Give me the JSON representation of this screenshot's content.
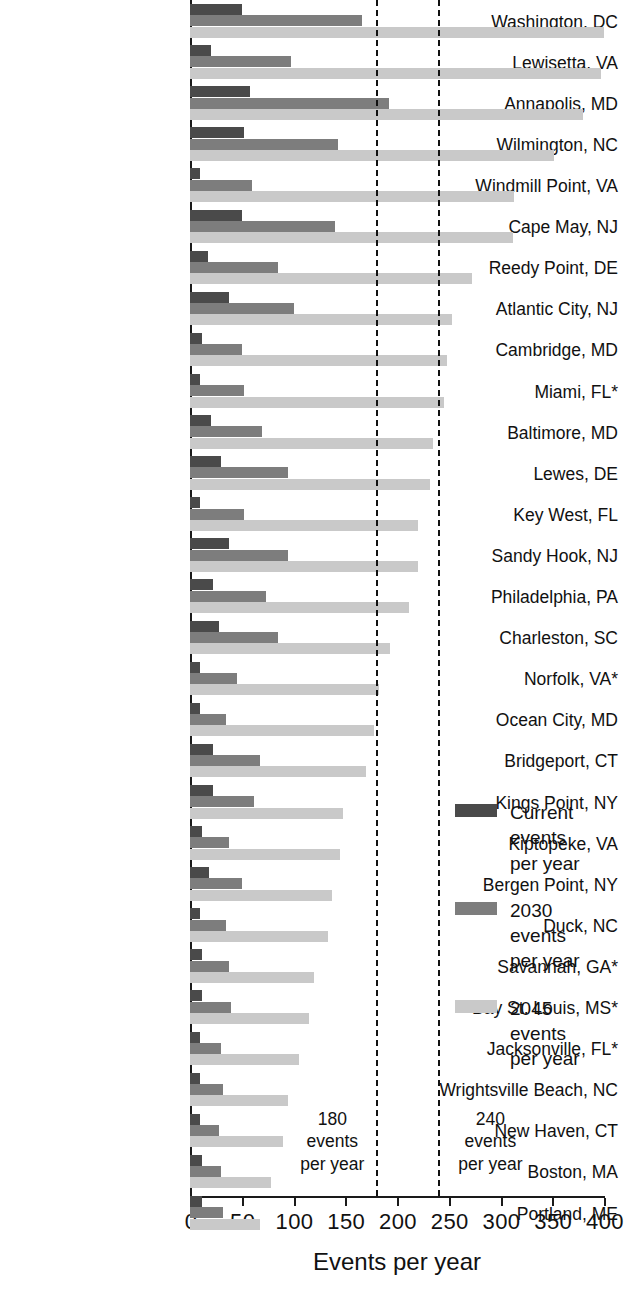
{
  "chart_data": {
    "type": "bar",
    "orientation": "horizontal",
    "title": "",
    "xlabel": "Events per year",
    "ylabel": "",
    "xlim": [
      0,
      400
    ],
    "xticks": [
      0,
      50,
      100,
      150,
      200,
      250,
      300,
      350,
      400
    ],
    "grid": false,
    "legend_position": "right",
    "categories": [
      "Washington, DC",
      "Lewisetta, VA",
      "Annapolis, MD",
      "Wilmington, NC",
      "Windmill Point, VA",
      "Cape May, NJ",
      "Reedy Point, DE",
      "Atlantic City, NJ",
      "Cambridge, MD",
      "Miami, FL*",
      "Baltimore, MD",
      "Lewes, DE",
      "Key West, FL",
      "Sandy Hook, NJ",
      "Philadelphia, PA",
      "Charleston, SC",
      "Norfolk, VA*",
      "Ocean City, MD",
      "Bridgeport, CT",
      "Kings Point, NY",
      "Kiptopeke, VA",
      "Bergen Point, NY",
      "Duck, NC",
      "Savannah, GA*",
      "Bay St. Louis, MS*",
      "Jacksonville, FL*",
      "Wrightsville Beach, NC",
      "New Haven, CT",
      "Boston, MA",
      "Portland, ME"
    ],
    "series": [
      {
        "name": "Current events per year",
        "key": "current",
        "color": "#4a4a4a",
        "values": [
          50,
          20,
          58,
          52,
          10,
          50,
          17,
          38,
          12,
          10,
          20,
          30,
          10,
          38,
          22,
          28,
          10,
          10,
          22,
          22,
          12,
          18,
          10,
          12,
          12,
          10,
          10,
          10,
          12,
          12
        ]
      },
      {
        "name": "2030 events per year",
        "key": "y2030",
        "color": "#7d7d7d",
        "values": [
          166,
          98,
          192,
          143,
          60,
          140,
          85,
          100,
          50,
          52,
          70,
          95,
          52,
          95,
          73,
          85,
          45,
          35,
          68,
          62,
          38,
          50,
          35,
          38,
          40,
          30,
          32,
          28,
          30,
          32
        ]
      },
      {
        "name": "2045 events per year",
        "key": "y2045",
        "color": "#c9c9c9",
        "values": [
          400,
          397,
          380,
          352,
          313,
          312,
          272,
          253,
          248,
          245,
          235,
          232,
          220,
          220,
          212,
          193,
          183,
          178,
          170,
          148,
          145,
          137,
          133,
          120,
          115,
          105,
          95,
          90,
          78,
          68
        ]
      }
    ],
    "thresholds": [
      {
        "value": 180,
        "label_lines": [
          "180",
          "events",
          "per year"
        ],
        "label_side": "left"
      },
      {
        "value": 240,
        "label_lines": [
          "240",
          "events",
          "per year"
        ],
        "label_side": "right"
      }
    ]
  },
  "legend": {
    "items": [
      {
        "swatch": "current",
        "lines": [
          "Current",
          "events",
          "per year"
        ]
      },
      {
        "swatch": "y2030",
        "lines": [
          "2030",
          "events",
          "per year"
        ]
      },
      {
        "swatch": "y2045",
        "lines": [
          "2045",
          "events",
          "per year"
        ]
      }
    ]
  }
}
